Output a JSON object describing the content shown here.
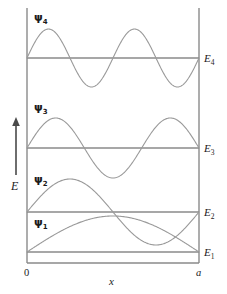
{
  "figure": {
    "background_color": "#ffffff",
    "line_color": "#808080",
    "curve_color": "#9a9a9a",
    "text_color": "#1a1a1a"
  },
  "axes": {
    "y_axis_label": "E",
    "y_axis_arrow": "up-arrow",
    "x_axis_label": "x",
    "x_ticks": [
      {
        "label": "0",
        "position": "left"
      },
      {
        "label": "a",
        "position": "right"
      }
    ]
  },
  "levels": [
    {
      "energy_label": "E",
      "energy_sub": "1",
      "wave_label": "ψ",
      "wave_sub": "1",
      "quantum_number": 1,
      "half_wavelengths": 1
    },
    {
      "energy_label": "E",
      "energy_sub": "2",
      "wave_label": "ψ",
      "wave_sub": "2",
      "quantum_number": 2,
      "half_wavelengths": 2
    },
    {
      "energy_label": "E",
      "energy_sub": "3",
      "wave_label": "ψ",
      "wave_sub": "3",
      "quantum_number": 3,
      "half_wavelengths": 3
    },
    {
      "energy_label": "E",
      "energy_sub": "4",
      "wave_label": "ψ",
      "wave_sub": "4",
      "quantum_number": 4,
      "half_wavelengths": 4
    }
  ],
  "chart_data": {
    "type": "line",
    "xlabel": "x",
    "ylabel": "E",
    "xlim": [
      0,
      1
    ],
    "x_tick_labels": [
      "0",
      "a"
    ],
    "grid": false,
    "legend": "none",
    "box_left_px": 27,
    "box_right_px": 199,
    "box_top_px": 8,
    "box_bottom_px": 263,
    "series": [
      {
        "name": "ψ1",
        "quantum_number": 1,
        "baseline_y_px": 252,
        "amplitude_px": 36,
        "nodes": 0,
        "label": "ψ",
        "sub": "1"
      },
      {
        "name": "ψ2",
        "quantum_number": 2,
        "baseline_y_px": 212,
        "amplitude_px": 33,
        "nodes": 1,
        "label": "ψ",
        "sub": "2"
      },
      {
        "name": "ψ3",
        "quantum_number": 3,
        "baseline_y_px": 148,
        "amplitude_px": 30,
        "nodes": 2,
        "label": "ψ",
        "sub": "3"
      },
      {
        "name": "ψ4",
        "quantum_number": 4,
        "baseline_y_px": 58,
        "amplitude_px": 29,
        "nodes": 3,
        "label": "ψ",
        "sub": "4"
      }
    ],
    "energy_levels": [
      {
        "name": "E1",
        "y_px": 252
      },
      {
        "name": "E2",
        "y_px": 212
      },
      {
        "name": "E3",
        "y_px": 148
      },
      {
        "name": "E4",
        "y_px": 58
      }
    ]
  }
}
